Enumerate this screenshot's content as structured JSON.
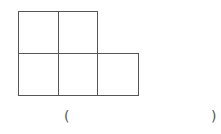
{
  "figure": {
    "stroke_color": "#555555",
    "cells": [
      {
        "row": 0,
        "col": 0
      },
      {
        "row": 0,
        "col": 1
      },
      {
        "row": 1,
        "col": 0
      },
      {
        "row": 1,
        "col": 1
      },
      {
        "row": 1,
        "col": 2
      }
    ]
  },
  "answer_blank": {
    "left_paren": "(",
    "right_paren": ")",
    "value": ""
  }
}
